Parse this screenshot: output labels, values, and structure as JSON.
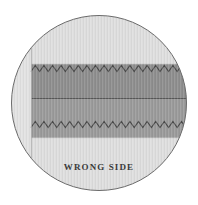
{
  "illustration": {
    "title": "zigzag-finished-seam-detail",
    "caption": "WRONG SIDE",
    "colors": {
      "page_background": "#ffffff",
      "circle_fill": "#e2e2e2",
      "circle_outline": "#6b6b6b",
      "fabric_upper_band": "#8e8e8e",
      "fabric_lower_band": "#9a9a9a",
      "fabric_light": "#d6d6d6",
      "stitch_line": "#4a4a4a",
      "seam_line": "#5a5a5a",
      "caption_color": "#3a3a3a"
    },
    "geometry": {
      "circle_center_x": 99,
      "circle_center_y": 103,
      "circle_radius": 88,
      "fabric_left_x": 31,
      "fabric_top_y": 64,
      "fabric_bottom_y": 138,
      "seam_line_y": 98,
      "upper_zigzag_y": 65,
      "lower_zigzag_y": 121,
      "zigzag_period": 8.6,
      "zigzag_amplitude": 6
    },
    "caption_position": {
      "x": 99,
      "y": 170
    }
  }
}
